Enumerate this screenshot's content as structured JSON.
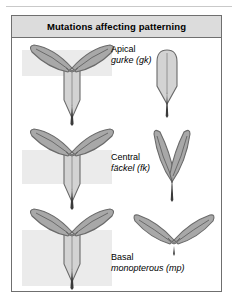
{
  "figure": {
    "title": "Mutations affecting patterning",
    "rows": [
      {
        "region": "Apical",
        "gene": "gurke (gk)",
        "wildtype_icon": "wild-type-seedling",
        "mutant_icon": "gurke-mutant-seedling",
        "band_icon": "apical-region-highlight"
      },
      {
        "region": "Central",
        "gene": "fäckel (fk)",
        "wildtype_icon": "wild-type-seedling",
        "mutant_icon": "fackel-mutant-seedling",
        "band_icon": "central-region-highlight"
      },
      {
        "region": "Basal",
        "gene": "monopterous (mp)",
        "wildtype_icon": "wild-type-seedling",
        "mutant_icon": "monopterous-mutant-seedling",
        "band_icon": "basal-region-highlight"
      }
    ]
  },
  "colors": {
    "frame_border": "#6f6f6f",
    "title_bar_fill": "#dcdcdc",
    "panel_fill": "#ffffff",
    "highlight_band": "#ebebeb",
    "organ_fill": "#a8a8a8",
    "organ_light_fill": "#d3d3d3",
    "organ_outline": "#6a6a6a",
    "vein_line": "#707070",
    "root_tip": "#3a3a3a"
  }
}
